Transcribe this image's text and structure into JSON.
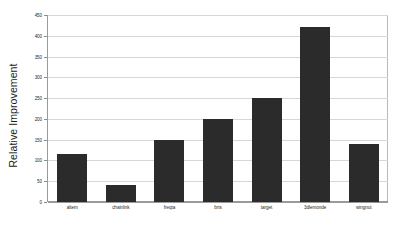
{
  "chart_data": {
    "type": "bar",
    "title": "",
    "xlabel": "",
    "ylabel": "Relative Improvement",
    "categories": [
      "altem",
      "chainlink",
      "freqta",
      "brts",
      "target",
      "3dlemonde",
      "wingnut"
    ],
    "values": [
      115,
      40,
      150,
      200,
      250,
      420,
      140
    ],
    "ylim": [
      0,
      450
    ],
    "yticks": [
      0,
      50,
      100,
      150,
      200,
      250,
      300,
      350,
      400,
      450
    ],
    "ytick_labels": [
      "0",
      "50",
      "100",
      "150",
      "200",
      "250",
      "300",
      "350",
      "400",
      "450"
    ],
    "grid": true,
    "legend": false,
    "bar_color": "#2b2b2b",
    "grid_color": "#d7d7d7",
    "axis_color": "#9a9a9a",
    "background": "#ffffff"
  }
}
